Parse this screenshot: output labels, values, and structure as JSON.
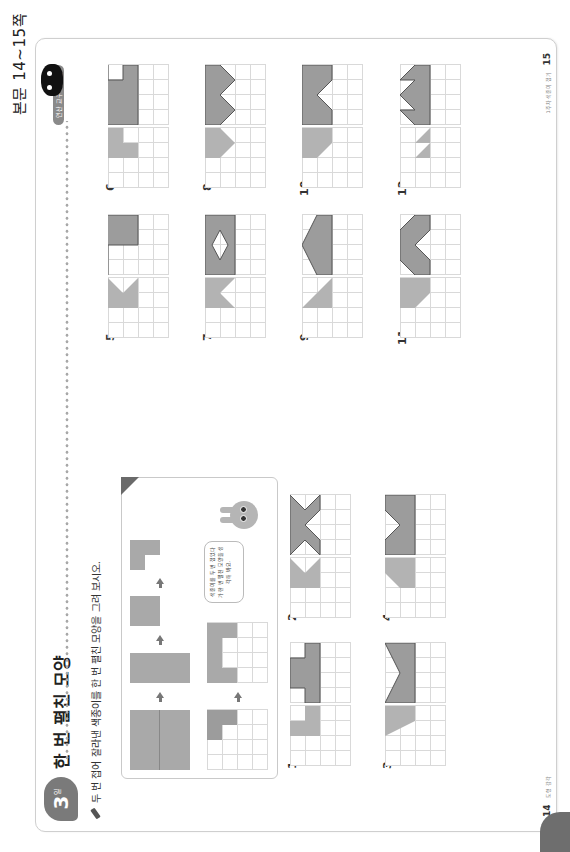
{
  "page_label": "본문 14~15쪽",
  "header": {
    "day_number": "3",
    "day_unit": "일",
    "title": "한 번 펼친 모양",
    "tag": "연산 교구 가는편"
  },
  "instruction": "두 번 접어 잘라낸 색종이를 한 번 펼친 모양을 그려 보시오.",
  "example": {
    "bubble_text": "색종이를 두 번 접었다가 한 번 펼친 모양을 생각해 봐요."
  },
  "problems": [
    {
      "number": "1"
    },
    {
      "number": "2"
    },
    {
      "number": "3"
    },
    {
      "number": "4"
    },
    {
      "number": "5"
    },
    {
      "number": "6"
    },
    {
      "number": "7"
    },
    {
      "number": "8"
    },
    {
      "number": "9"
    },
    {
      "number": "10"
    },
    {
      "number": "11"
    },
    {
      "number": "12"
    }
  ],
  "footer": {
    "left_page": "14",
    "left_label": "도형 감각",
    "right_page": "15",
    "right_label": "1주차 색종이 접기"
  },
  "colors": {
    "folded_fill": "#b3b3b3",
    "answer_fill": "#9c9c9c",
    "answer_stroke": "#555555",
    "grid_line": "#d9d9d9"
  }
}
